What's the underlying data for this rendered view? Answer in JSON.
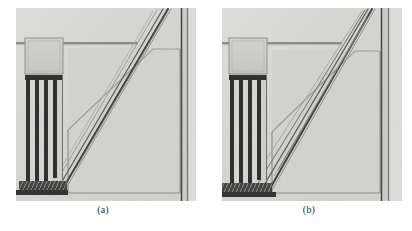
{
  "figure": {
    "type": "micrograph-pair",
    "background_color": "#ffffff",
    "panels": [
      {
        "id": "panel-a",
        "caption": "(a)",
        "substrate_color": "#d8d8d6",
        "substrate_color_light": "#e2e2e0",
        "substrate_color_dark": "#c9c9c6",
        "feature_line_color": "#4a4a4a",
        "feature_dark_color": "#2e2e2e",
        "bond_pad": {
          "name": "square-bond-pad",
          "x": 9,
          "y": 30,
          "width": 38,
          "height": 36,
          "fill": "#cdcdca",
          "border": "#9a9a96"
        },
        "comb_fingers": {
          "name": "comb-finger-array",
          "count": 4,
          "x": 9,
          "y": 68,
          "width": 38,
          "height": 106,
          "finger_color": "#2a2a2a"
        },
        "anchor_band": {
          "name": "hatched-anchor-band",
          "x": 5,
          "y": 172,
          "width": 46,
          "height": 9,
          "fill": "#3a3a3a"
        },
        "horizontal_trace": {
          "name": "horizontal-trace",
          "x1": 2,
          "y1": 35,
          "x2": 120,
          "y2": 35
        },
        "diagonal_beams": {
          "name": "diagonal-beam-bundle",
          "count": 4,
          "top_x": 152,
          "top_y": 2,
          "bottom_x": 48,
          "bottom_y": 180,
          "spread": 9
        },
        "right_rail": {
          "name": "right-vertical-rail",
          "x": 166,
          "y": 0,
          "width": 6,
          "height": 193
        },
        "lower_chamber": {
          "name": "lower-chamber-outline",
          "x": 52,
          "y": 40,
          "width": 112,
          "height": 145
        }
      },
      {
        "id": "panel-b",
        "caption": "(b)",
        "substrate_color": "#d8d8d6",
        "substrate_color_light": "#e2e2e0",
        "substrate_color_dark": "#c9c9c6",
        "feature_line_color": "#4a4a4a",
        "feature_dark_color": "#2e2e2e",
        "bond_pad": {
          "name": "square-bond-pad",
          "x": 7,
          "y": 30,
          "width": 38,
          "height": 36,
          "fill": "#cdcdca",
          "border": "#9a9a96"
        },
        "comb_fingers": {
          "name": "comb-finger-array",
          "count": 4,
          "x": 7,
          "y": 68,
          "width": 38,
          "height": 108,
          "finger_color": "#2a2a2a"
        },
        "anchor_band": {
          "name": "hatched-anchor-band",
          "x": 3,
          "y": 174,
          "width": 46,
          "height": 9,
          "fill": "#3a3a3a"
        },
        "horizontal_trace": {
          "name": "horizontal-trace",
          "x1": 0,
          "y1": 35,
          "x2": 118,
          "y2": 35
        },
        "diagonal_beams": {
          "name": "diagonal-beam-bundle",
          "count": 4,
          "top_x": 150,
          "top_y": 2,
          "bottom_x": 46,
          "bottom_y": 182,
          "spread": 13
        },
        "right_rail": {
          "name": "right-vertical-rail",
          "x": 160,
          "y": 0,
          "width": 7,
          "height": 193
        },
        "lower_chamber": {
          "name": "lower-chamber-outline",
          "x": 50,
          "y": 42,
          "width": 108,
          "height": 143
        }
      }
    ]
  }
}
